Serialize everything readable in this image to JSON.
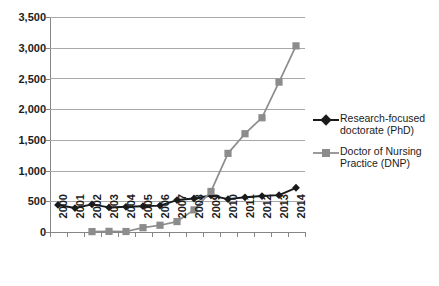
{
  "chart_data": {
    "type": "line",
    "title": "",
    "subtitle": "",
    "xlabel": "",
    "ylabel": "",
    "categories": [
      "2000",
      "2001",
      "2002",
      "2003",
      "2004",
      "2005",
      "2006",
      "2007",
      "2008",
      "2009",
      "2010",
      "2011",
      "2012",
      "2013",
      "2014"
    ],
    "x_tick_labels": [
      "2000",
      "2001",
      "2002",
      "2003",
      "2004",
      "2005",
      "2006",
      "2007",
      "2008",
      "2009",
      "2010",
      "2011",
      "2012",
      "2013",
      "2014"
    ],
    "y_tick_labels": [
      "0",
      "500",
      "1,000",
      "1,500",
      "2,000",
      "2,500",
      "3,000",
      "3,500"
    ],
    "y_tick_values": [
      0,
      500,
      1000,
      1500,
      2000,
      2500,
      3000,
      3500
    ],
    "ylim": [
      0,
      3500
    ],
    "grid": true,
    "legend_position": "right",
    "series": [
      {
        "name": "Research-focused doctorate (PhD)",
        "color": "#1a1a1a",
        "marker": "diamond",
        "values": [
          440,
          390,
          450,
          400,
          410,
          420,
          430,
          520,
          545,
          595,
          535,
          565,
          585,
          600,
          720
        ]
      },
      {
        "name": "Doctor of Nursing Practice (DNP)",
        "color": "#8c8c8c",
        "marker": "square",
        "values": [
          null,
          null,
          6,
          10,
          8,
          70,
          110,
          170,
          360,
          660,
          1280,
          1600,
          1860,
          2440,
          3030
        ]
      }
    ]
  },
  "legend": {
    "entries": [
      {
        "label_line_1": "Research-focused",
        "label_line_2": "doctorate (PhD)",
        "color": "#1a1a1a",
        "marker": "diamond"
      },
      {
        "label_line_1": "Doctor of Nursing",
        "label_line_2": "Practice (DNP)",
        "color": "#8c8c8c",
        "marker": "square"
      }
    ]
  },
  "colors": {
    "background": "#ffffff",
    "gridline": "#a8a8a8",
    "axis": "#868686",
    "series_phd": "#1a1a1a",
    "series_dnp": "#8c8c8c",
    "text": "#1c1c1c"
  }
}
